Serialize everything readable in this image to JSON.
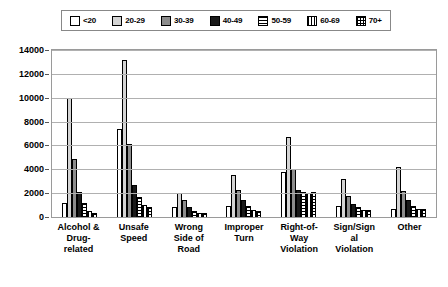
{
  "chart_data": {
    "type": "bar",
    "title": "",
    "subtitle": "",
    "xlabel": "",
    "ylabel": "",
    "ylim": [
      0,
      14000
    ],
    "ytick_step": 2000,
    "ytick_labels": [
      "0",
      "2000",
      "4000",
      "6000",
      "8000",
      "10000",
      "12000",
      "14000"
    ],
    "grid": true,
    "legend_position": "top",
    "categories": [
      "Alcohol & Drug-related",
      "Unsafe Speed",
      "Wrong Side of Road",
      "Improper Turn",
      "Right-of-Way Violation",
      "Sign/Signal Violation",
      "Other"
    ],
    "category_lines": [
      [
        "Alcohol &",
        "Drug-",
        "related"
      ],
      [
        "Unsafe",
        "Speed"
      ],
      [
        "Wrong",
        "Side of",
        "Road"
      ],
      [
        "Improper",
        "Turn"
      ],
      [
        "Right-of-",
        "Way",
        "Violation"
      ],
      [
        "Sign/Sign",
        "al",
        "Violation"
      ],
      [
        "Other"
      ]
    ],
    "series": [
      {
        "name": "<20",
        "pattern": "solid-white",
        "color": "#ffffff",
        "values": [
          1200,
          7400,
          800,
          900,
          3800,
          900,
          700
        ]
      },
      {
        "name": "20-29",
        "pattern": "solid-light",
        "color": "#d4d4d4",
        "values": [
          10000,
          13200,
          2000,
          3500,
          6700,
          3200,
          4200
        ]
      },
      {
        "name": "30-39",
        "pattern": "solid-mid",
        "color": "#8c8c8c",
        "values": [
          4900,
          6100,
          1400,
          2300,
          4000,
          1800,
          2200
        ]
      },
      {
        "name": "40-49",
        "pattern": "solid-dark",
        "color": "#1a1a1a",
        "values": [
          2100,
          2700,
          800,
          1400,
          2300,
          1100,
          1400
        ]
      },
      {
        "name": "50-59",
        "pattern": "horizontal",
        "color": "#ffffff",
        "values": [
          1200,
          1700,
          500,
          900,
          2100,
          800,
          900
        ]
      },
      {
        "name": "60-69",
        "pattern": "vertical",
        "color": "#ffffff",
        "values": [
          500,
          1000,
          350,
          600,
          2000,
          600,
          700
        ]
      },
      {
        "name": "70+",
        "pattern": "crosshatch",
        "color": "#ffffff",
        "values": [
          300,
          800,
          300,
          500,
          2100,
          600,
          700
        ]
      }
    ]
  },
  "legend": {
    "items": [
      {
        "label": "<20"
      },
      {
        "label": "20-29"
      },
      {
        "label": "30-39"
      },
      {
        "label": "40-49"
      },
      {
        "label": "50-59"
      },
      {
        "label": "60-69"
      },
      {
        "label": "70+"
      }
    ]
  }
}
